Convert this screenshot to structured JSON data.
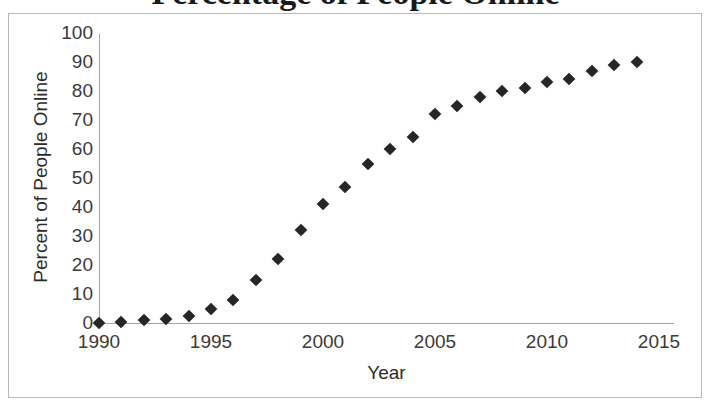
{
  "figure": {
    "title_partial": "Percentage of People Online",
    "border_color": "#b8b8b8",
    "background": "#ffffff",
    "marker_color": "#262626",
    "axis_color": "#a6a6a6"
  },
  "chart_data": {
    "type": "scatter",
    "title": "Percentage of People Online",
    "xlabel": "Year",
    "ylabel": "Percent of People Online",
    "xlim": [
      1990,
      2015
    ],
    "ylim": [
      0,
      100
    ],
    "xticks": [
      "1990",
      "1995",
      "2000",
      "2005",
      "2010",
      "2015"
    ],
    "yticks": [
      "0",
      "10",
      "20",
      "30",
      "40",
      "50",
      "60",
      "70",
      "80",
      "90",
      "100"
    ],
    "grid": false,
    "legend": "none",
    "marker": "diamond",
    "x": [
      1990,
      1991,
      1992,
      1993,
      1994,
      1995,
      1996,
      1997,
      1998,
      1999,
      2000,
      2001,
      2002,
      2003,
      2004,
      2005,
      2006,
      2007,
      2008,
      2009,
      2010,
      2011,
      2012,
      2013,
      2014
    ],
    "values": [
      0,
      0.5,
      1,
      1.5,
      2.5,
      5,
      8,
      15,
      22,
      32,
      41,
      47,
      55,
      60,
      64,
      72,
      75,
      78,
      80,
      81,
      83,
      84,
      87,
      89,
      90
    ],
    "series": [
      {
        "name": "Percent of People Online",
        "values": [
          0,
          0.5,
          1,
          1.5,
          2.5,
          5,
          8,
          15,
          22,
          32,
          41,
          47,
          55,
          60,
          64,
          72,
          75,
          78,
          80,
          81,
          83,
          84,
          87,
          89,
          90
        ]
      }
    ]
  }
}
